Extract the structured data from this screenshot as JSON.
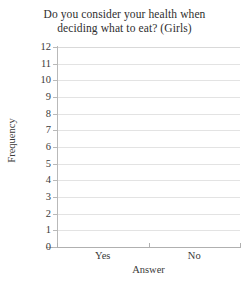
{
  "chart_data": {
    "type": "bar",
    "title": "Do you consider your health when deciding what to eat? (Girls)",
    "title_lines": [
      "Do you consider your health when",
      "deciding what to eat? (Girls)"
    ],
    "xlabel": "Answer",
    "ylabel": "Frequency",
    "categories": [
      "Yes",
      "No"
    ],
    "values": [
      null,
      null
    ],
    "series": [
      {
        "name": "Frequency",
        "values": [
          null,
          null
        ]
      }
    ],
    "ylim": [
      0,
      12
    ],
    "ytick_labels": [
      "0",
      "1",
      "2",
      "3",
      "4",
      "5",
      "6",
      "7",
      "8",
      "9",
      "10",
      "11",
      "12"
    ],
    "ytick_values": [
      0,
      1,
      2,
      3,
      4,
      5,
      6,
      7,
      8,
      9,
      10,
      11,
      12
    ],
    "grid": true,
    "grid_orientation": "horizontal",
    "legend": false,
    "legend_position": "none",
    "annotations": [],
    "note": "Blank chart template - axes and gridlines drawn, no bars plotted",
    "colors": {
      "background": "#ffffff",
      "gridline": "#e3e3e3",
      "axis": "#b0b0b0",
      "text": "#3a3a3a"
    }
  }
}
